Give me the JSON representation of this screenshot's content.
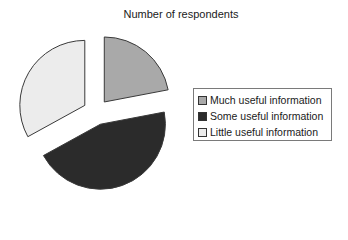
{
  "chart_data": {
    "type": "pie",
    "title": "Number of respondents",
    "categories": [
      "Much useful information",
      "Some useful information",
      "Little useful information"
    ],
    "values": [
      22,
      45,
      33
    ],
    "unit": "percent (estimated from slice angles)",
    "colors": [
      "#a9a9a9",
      "#2b2b2b",
      "#ececec"
    ],
    "exploded": true,
    "legend_position": "right"
  },
  "legend": {
    "items": [
      {
        "label": "Much useful information",
        "color": "#a9a9a9"
      },
      {
        "label": "Some useful information",
        "color": "#2b2b2b"
      },
      {
        "label": "Little useful information",
        "color": "#ececec"
      }
    ]
  }
}
